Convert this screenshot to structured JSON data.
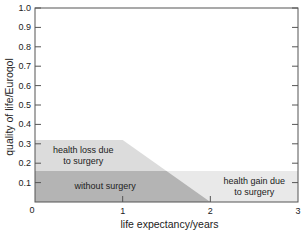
{
  "chart_data": {
    "type": "area",
    "title": "",
    "xlabel": "life expectancy/years",
    "ylabel": "quality of life/Euroqol",
    "xlim": [
      0,
      3
    ],
    "ylim": [
      0,
      1.0
    ],
    "x_ticks": [
      {
        "value": 0,
        "label": "0"
      },
      {
        "value": 1,
        "label": "1"
      },
      {
        "value": 2,
        "label": "2"
      },
      {
        "value": 3,
        "label": "3"
      }
    ],
    "y_ticks": [
      {
        "value": 0.1,
        "label": "0.1"
      },
      {
        "value": 0.2,
        "label": "0.2"
      },
      {
        "value": 0.3,
        "label": "0.3"
      },
      {
        "value": 0.4,
        "label": "0.4"
      },
      {
        "value": 0.5,
        "label": "0.5"
      },
      {
        "value": 0.6,
        "label": "0.6"
      },
      {
        "value": 0.7,
        "label": "0.7"
      },
      {
        "value": 0.8,
        "label": "0.8"
      },
      {
        "value": 0.9,
        "label": "0.9"
      },
      {
        "value": 1.0,
        "label": "1.0"
      }
    ],
    "grid": false,
    "regions": [
      {
        "name": "health gain due to surgery",
        "label_lines": [
          "health gain due",
          "to surgery"
        ],
        "color": "#e9e9e9",
        "polygon": [
          [
            0,
            0
          ],
          [
            3,
            0
          ],
          [
            3,
            0.16
          ],
          [
            0,
            0.16
          ]
        ],
        "label_at": [
          2.5,
          0.08
        ]
      },
      {
        "name": "health loss due to surgery",
        "label_lines": [
          "health loss due",
          "to surgery"
        ],
        "color": "#dcdcdc",
        "polygon": [
          [
            0,
            0.16
          ],
          [
            0,
            0.32
          ],
          [
            1,
            0.32
          ],
          [
            1.5,
            0.16
          ]
        ],
        "label_at": [
          0.55,
          0.24
        ]
      },
      {
        "name": "without surgery",
        "label_lines": [
          "without surgery"
        ],
        "color": "#b4b4b4",
        "polygon": [
          [
            0,
            0
          ],
          [
            0,
            0.16
          ],
          [
            1.5,
            0.16
          ],
          [
            2,
            0
          ]
        ],
        "label_at": [
          0.8,
          0.08
        ]
      }
    ]
  }
}
